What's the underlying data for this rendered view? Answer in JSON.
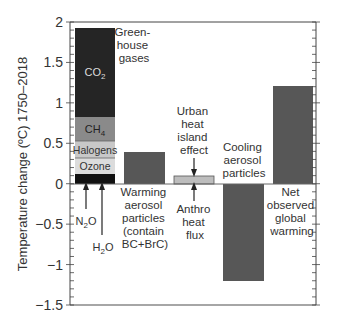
{
  "chart_data": {
    "type": "bar",
    "stacked_first_bar": true,
    "title": "",
    "xlabel": "",
    "ylabel": "Temperature change (ºC) 1750–2018",
    "ylim": [
      -1.5,
      2
    ],
    "yticks": [
      2,
      1.5,
      1,
      0.5,
      0,
      -0.5,
      -1,
      -1.5
    ],
    "ytick_labels": [
      "2",
      "1.5",
      "1",
      "0.5",
      "0",
      "−0.5",
      "−1",
      "−1.5"
    ],
    "minor_tick_step": 0.1,
    "grid": false,
    "legend": "none (inline annotations)",
    "categories": [
      "Greenhouse gases",
      "Warming aerosol particles (contain BC+BrC)",
      "Urban heat island effect / Anthro heat flux",
      "Cooling aerosol particles",
      "Net observed global warming"
    ],
    "stack": {
      "label": "Green-house gases",
      "segments": [
        {
          "name": "N2O + H2O",
          "value": 0.12,
          "color": "#111111"
        },
        {
          "name": "Ozone",
          "value": 0.2,
          "color": "#dcdcdc"
        },
        {
          "name": "Halogens",
          "value": 0.21,
          "color": "#c8c8c8"
        },
        {
          "name": "CH4",
          "value": 0.3,
          "color": "#8a8a8a"
        },
        {
          "name": "CO2",
          "value": 1.1,
          "color": "#252525"
        }
      ],
      "total": 1.93
    },
    "values": [
      1.93,
      0.4,
      0.1,
      -1.2,
      1.21
    ],
    "bar_colors": [
      "stacked",
      "#575757",
      "#bdbdbd",
      "#575757",
      "#575757"
    ]
  },
  "annotations": {
    "greenhouse": [
      "Green-",
      "house",
      "gases"
    ],
    "co2": "CO",
    "co2_sub": "2",
    "ch4": "CH",
    "ch4_sub": "4",
    "halogens": "Halogens",
    "ozone": "Ozone",
    "n2o_a": "N",
    "n2o_sub": "2",
    "n2o_b": "O",
    "h2o_a": "H",
    "h2o_sub": "2",
    "h2o_b": "O",
    "warming": [
      "Warming",
      "aerosol",
      "particles",
      "(contain",
      "BC+BrC)"
    ],
    "urban": [
      "Urban",
      "heat",
      "island",
      "effect"
    ],
    "anthro": [
      "Anthro",
      "heat",
      "flux"
    ],
    "cooling": [
      "Cooling",
      "aerosol",
      "particles"
    ],
    "net": [
      "Net",
      "observed",
      "global",
      "warming"
    ]
  }
}
